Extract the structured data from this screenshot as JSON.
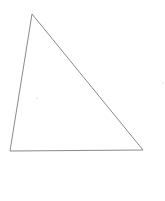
{
  "diagram": {
    "type": "triangle",
    "background": "#ffffff",
    "stroke_color": "#8a8a8a",
    "stroke_width": 1,
    "vertices": [
      {
        "name": "top",
        "x": 32,
        "y": 14
      },
      {
        "name": "bottom-left",
        "x": 10,
        "y": 151
      },
      {
        "name": "bottom-right",
        "x": 143,
        "y": 150
      }
    ],
    "marks": [
      {
        "name": "interior-dot",
        "x": 37,
        "y": 98,
        "color": "#d6d6d6"
      },
      {
        "name": "exterior-dot",
        "x": 163,
        "y": 83,
        "color": "#e6e6e6"
      }
    ]
  }
}
